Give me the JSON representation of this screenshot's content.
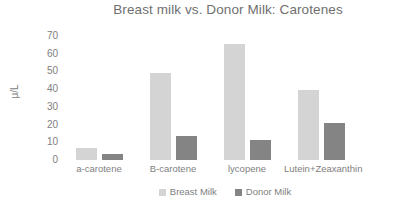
{
  "chart_data": {
    "type": "bar",
    "title": "Breast milk vs. Donor Milk: Carotenes",
    "xlabel": "",
    "ylabel": "μ/L",
    "ylim": [
      0,
      70
    ],
    "yticks": [
      70,
      60,
      50,
      40,
      30,
      20,
      10,
      0
    ],
    "grid": false,
    "legend_position": "bottom",
    "categories": [
      "a-carotene",
      "B-carotene",
      "lycopene",
      "Lutein+Zeaxanthin"
    ],
    "series": [
      {
        "name": "Breast Milk",
        "color": "#d4d4d4",
        "values": [
          7,
          49,
          65.5,
          39.5
        ]
      },
      {
        "name": "Donor Milk",
        "color": "#848484",
        "values": [
          3.5,
          13.5,
          11.5,
          21
        ]
      }
    ]
  },
  "colors": {
    "breast_milk": "#d4d4d4",
    "donor_milk": "#848484",
    "text": "#808080",
    "background": "#ffffff"
  }
}
